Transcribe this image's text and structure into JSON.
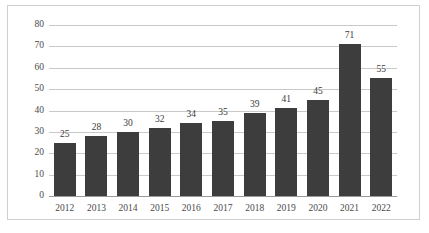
{
  "chart_data": {
    "type": "bar",
    "title": "",
    "subtitle": "",
    "xlabel": "",
    "ylabel": "",
    "categories": [
      "2012",
      "2013",
      "2014",
      "2015",
      "2016",
      "2017",
      "2018",
      "2019",
      "2020",
      "2021",
      "2022"
    ],
    "values": [
      25,
      28,
      30,
      32,
      34,
      35,
      39,
      41,
      45,
      71,
      55
    ],
    "data_labels": [
      "25",
      "28",
      "30",
      "32",
      "34",
      "35",
      "39",
      "41",
      "45",
      "71",
      "55"
    ],
    "ylim": [
      0,
      80
    ],
    "ytick_values": [
      0,
      10,
      20,
      30,
      40,
      50,
      60,
      70,
      80
    ],
    "ytick_labels": [
      "0",
      "10",
      "20",
      "30",
      "40",
      "50",
      "60",
      "70",
      "80"
    ],
    "grid": "horizontal",
    "legend": "none",
    "series": [
      {
        "name": "",
        "values": [
          25,
          28,
          30,
          32,
          34,
          35,
          39,
          41,
          45,
          71,
          55
        ]
      }
    ],
    "colors": {
      "bar": "#3d3d3d",
      "gridline": "#c9c9c9",
      "axis": "#9a9a9a",
      "label_text": "#4a4a4a",
      "value_text": "#3a3a3a",
      "frame_border": "#cfcfcf",
      "background": "#ffffff"
    }
  }
}
